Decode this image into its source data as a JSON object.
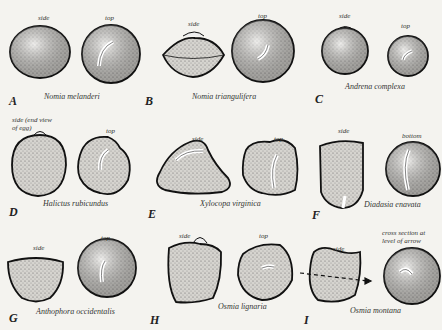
{
  "figure": {
    "panels": [
      {
        "letter": "A",
        "species": "Nomia melanderi",
        "views": [
          "side",
          "top"
        ]
      },
      {
        "letter": "B",
        "species": "Nomia triangulifera",
        "views": [
          "side",
          "top"
        ]
      },
      {
        "letter": "C",
        "species": "Andrena complexa",
        "views": [
          "side",
          "top"
        ]
      },
      {
        "letter": "D",
        "species": "Halictus rubicundus",
        "views": [
          "side (end view\nof egg)",
          "top"
        ]
      },
      {
        "letter": "E",
        "species": "Xylocopa virginica",
        "views": [
          "side",
          "top"
        ]
      },
      {
        "letter": "F",
        "species": "Diadasia enavata",
        "views": [
          "side",
          "bottom"
        ]
      },
      {
        "letter": "G",
        "species": "Anthophora occidentalis",
        "views": [
          "side",
          "top"
        ]
      },
      {
        "letter": "H",
        "species": "Osmia lignaria",
        "views": [
          "side",
          "top"
        ]
      },
      {
        "letter": "I",
        "species": "Osmia montana",
        "views": [
          "side",
          "cross section at\nlevel of arrow"
        ]
      }
    ]
  }
}
